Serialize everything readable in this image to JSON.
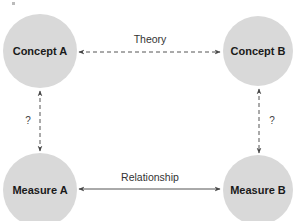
{
  "diagram": {
    "nodes": {
      "concept_a": {
        "label": "Concept A"
      },
      "concept_b": {
        "label": "Concept B"
      },
      "measure_a": {
        "label": "Measure A"
      },
      "measure_b": {
        "label": "Measure B"
      }
    },
    "edges": {
      "theory": {
        "label": "Theory",
        "style": "dashed",
        "direction": "bidirectional"
      },
      "relationship": {
        "label": "Relationship",
        "style": "solid",
        "direction": "bidirectional"
      },
      "left_vertical": {
        "label": "?",
        "style": "dashed",
        "direction": "bidirectional"
      },
      "right_vertical": {
        "label": "?",
        "style": "dashed",
        "direction": "bidirectional"
      }
    },
    "colors": {
      "node_fill": "#d9d9d9",
      "line": "#555555",
      "text": "#1a1a1a"
    }
  }
}
